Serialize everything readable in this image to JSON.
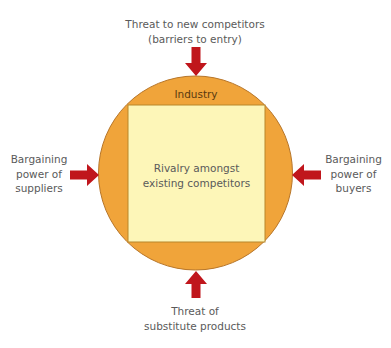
{
  "diagram": {
    "type": "porters-five-forces",
    "industry": {
      "label": "Industry"
    },
    "center": {
      "lines": [
        "Rivalry amongst",
        "existing competitors"
      ]
    },
    "forces": {
      "top": {
        "lines": [
          "Threat to new competitors",
          "(barriers to entry)"
        ],
        "arrow_direction": "down"
      },
      "bottom": {
        "lines": [
          "Threat of",
          "substitute products"
        ],
        "arrow_direction": "up"
      },
      "left": {
        "lines": [
          "Bargaining",
          "power of",
          "suppliers"
        ],
        "arrow_direction": "right"
      },
      "right": {
        "lines": [
          "Bargaining",
          "power of",
          "buyers"
        ],
        "arrow_direction": "left"
      }
    },
    "colors": {
      "circle_fill": "#f0a43a",
      "circle_stroke": "#b7762a",
      "square_fill": "#fdf6b8",
      "square_stroke": "#b7862a",
      "arrow": "#c0161c"
    }
  }
}
